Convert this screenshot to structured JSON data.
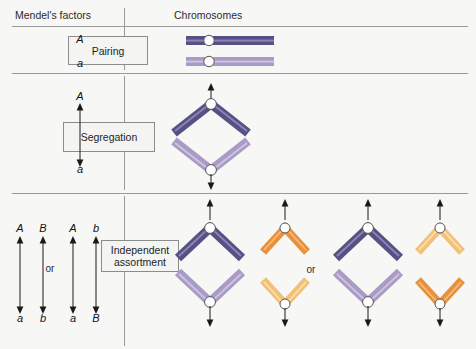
{
  "figure": {
    "background_color": "#f7f7f5",
    "rule_color": "#9a9a9a"
  },
  "headers": {
    "factors": "Mendel's factors",
    "chromosomes": "Chromosomes"
  },
  "stages": [
    {
      "id": "pairing",
      "label": "Pairing"
    },
    {
      "id": "segregation",
      "label": "Segregation"
    },
    {
      "id": "independent-assortment",
      "label": "Independent\nassortment",
      "line1": "Independent",
      "line2": "assortment"
    }
  ],
  "pairing_row": {
    "top_allele": "A",
    "bottom_allele": "a"
  },
  "segregation_row": {
    "top_allele": "A",
    "bottom_allele": "a"
  },
  "assortment_row": {
    "or_label": "or",
    "columns": [
      {
        "top": "A",
        "bottom": "a"
      },
      {
        "top": "B",
        "bottom": "b"
      },
      {
        "top": "A",
        "bottom": "a"
      },
      {
        "top": "b",
        "bottom": "B"
      }
    ],
    "chromosome_or_label": "or"
  },
  "colors": {
    "chromosome_dark_purple": "#565184",
    "chromosome_dark_purple_highlight": "#7d78a8",
    "chromosome_light_purple": "#a99ac6",
    "chromosome_light_purple_highlight": "#c9bfdd",
    "chromosome_dark_orange": "#e8913c",
    "chromosome_dark_orange_highlight": "#f2b06b",
    "chromosome_light_orange": "#f3c078",
    "chromosome_light_orange_highlight": "#f8d9a8",
    "centromere_fill": "#ffffff",
    "centromere_stroke": "#555555",
    "arrow_color": "#1a1a1a",
    "text_color": "#1e1e1e"
  }
}
